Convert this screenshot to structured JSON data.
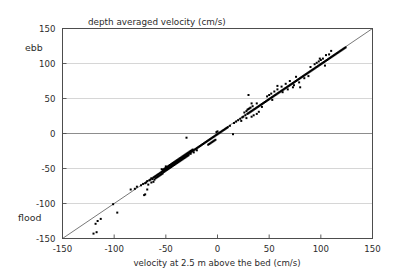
{
  "chart_data": {
    "type": "scatter",
    "title": "depth averaged velocity (cm/s)",
    "xlabel": "velocity at 2.5 m above the bed (cm/s)",
    "ylabel": "",
    "xlim": [
      -150,
      150
    ],
    "ylim": [
      -150,
      150
    ],
    "xticks": [
      -150,
      -100,
      -50,
      0,
      50,
      100,
      150
    ],
    "yticks": [
      -150,
      -100,
      -50,
      0,
      50,
      100,
      150
    ],
    "xticklabels": [
      "-150",
      "-100",
      "-50",
      "0",
      "50",
      "100",
      "150"
    ],
    "yticklabels": [
      "-150",
      "-100",
      "-50",
      "0",
      "50",
      "100",
      "150"
    ],
    "grid": "horizontal",
    "grid_color": "#cccccc",
    "zero_line_color": "#808080",
    "marker": "square",
    "marker_size": 2,
    "marker_color": "#000000",
    "reference_line": {
      "name": "one-to-one-line",
      "from": [
        -150,
        -150
      ],
      "to": [
        150,
        150
      ],
      "color": "#555555"
    },
    "annotations": [
      {
        "name": "ebb-label",
        "text": "ebb",
        "x": -150,
        "y": 120,
        "position": "left-outside"
      },
      {
        "name": "flood-label",
        "text": "flood",
        "x": -150,
        "y": -125,
        "position": "left-outside"
      }
    ],
    "points": [
      [
        -120,
        -143
      ],
      [
        -117,
        -141
      ],
      [
        -118,
        -129
      ],
      [
        -116,
        -125
      ],
      [
        -113,
        -122
      ],
      [
        -101,
        -101
      ],
      [
        -97,
        -113
      ],
      [
        -84,
        -80
      ],
      [
        -80,
        -79
      ],
      [
        -78,
        -76
      ],
      [
        -74,
        -74
      ],
      [
        -72,
        -72
      ],
      [
        -71,
        -88
      ],
      [
        -70,
        -87
      ],
      [
        -70,
        -71
      ],
      [
        -69,
        -70
      ],
      [
        -68,
        -80
      ],
      [
        -68,
        -68
      ],
      [
        -67,
        -73
      ],
      [
        -66,
        -67
      ],
      [
        -65,
        -66
      ],
      [
        -64,
        -70
      ],
      [
        -64,
        -64
      ],
      [
        -63,
        -65
      ],
      [
        -62,
        -63
      ],
      [
        -62,
        -69
      ],
      [
        -61,
        -62
      ],
      [
        -61,
        -66
      ],
      [
        -60,
        -61
      ],
      [
        -60,
        -64
      ],
      [
        -59,
        -60
      ],
      [
        -59,
        -63
      ],
      [
        -58,
        -59
      ],
      [
        -58,
        -62
      ],
      [
        -57,
        -58
      ],
      [
        -57,
        -61
      ],
      [
        -56,
        -57
      ],
      [
        -56,
        -60
      ],
      [
        -55,
        -56
      ],
      [
        -55,
        -59
      ],
      [
        -54,
        -55
      ],
      [
        -54,
        -58
      ],
      [
        -54,
        -51
      ],
      [
        -53,
        -54
      ],
      [
        -53,
        -52
      ],
      [
        -53,
        -57
      ],
      [
        -52,
        -53
      ],
      [
        -52,
        -51
      ],
      [
        -52,
        -55
      ],
      [
        -51,
        -52
      ],
      [
        -51,
        -50
      ],
      [
        -51,
        -54
      ],
      [
        -50,
        -51
      ],
      [
        -50,
        -49
      ],
      [
        -50,
        -53
      ],
      [
        -50,
        -47
      ],
      [
        -49,
        -50
      ],
      [
        -49,
        -48
      ],
      [
        -49,
        -52
      ],
      [
        -48,
        -49
      ],
      [
        -48,
        -47
      ],
      [
        -48,
        -51
      ],
      [
        -47,
        -48
      ],
      [
        -47,
        -46
      ],
      [
        -47,
        -50
      ],
      [
        -46,
        -47
      ],
      [
        -46,
        -45
      ],
      [
        -46,
        -49
      ],
      [
        -45,
        -46
      ],
      [
        -45,
        -44
      ],
      [
        -45,
        -48
      ],
      [
        -44,
        -45
      ],
      [
        -44,
        -43
      ],
      [
        -44,
        -47
      ],
      [
        -43,
        -44
      ],
      [
        -43,
        -42
      ],
      [
        -43,
        -46
      ],
      [
        -42,
        -43
      ],
      [
        -42,
        -41
      ],
      [
        -42,
        -45
      ],
      [
        -41,
        -42
      ],
      [
        -41,
        -40
      ],
      [
        -41,
        -44
      ],
      [
        -40,
        -41
      ],
      [
        -40,
        -39
      ],
      [
        -40,
        -43
      ],
      [
        -39,
        -40
      ],
      [
        -39,
        -38
      ],
      [
        -39,
        -42
      ],
      [
        -38,
        -39
      ],
      [
        -38,
        -37
      ],
      [
        -38,
        -41
      ],
      [
        -37,
        -38
      ],
      [
        -37,
        -36
      ],
      [
        -37,
        -40
      ],
      [
        -36,
        -37
      ],
      [
        -36,
        -35
      ],
      [
        -36,
        -39
      ],
      [
        -35,
        -36
      ],
      [
        -35,
        -34
      ],
      [
        -35,
        -38
      ],
      [
        -34,
        -35
      ],
      [
        -34,
        -33
      ],
      [
        -34,
        -37
      ],
      [
        -33,
        -34
      ],
      [
        -33,
        -32
      ],
      [
        -33,
        -36
      ],
      [
        -32,
        -33
      ],
      [
        -32,
        -31
      ],
      [
        -32,
        -35
      ],
      [
        -31,
        -32
      ],
      [
        -31,
        -30
      ],
      [
        -31,
        -34
      ],
      [
        -30,
        -31
      ],
      [
        -30,
        -29
      ],
      [
        -30,
        -33
      ],
      [
        -30,
        -6
      ],
      [
        -29,
        -30
      ],
      [
        -29,
        -28
      ],
      [
        -29,
        -32
      ],
      [
        -28,
        -29
      ],
      [
        -28,
        -27
      ],
      [
        -28,
        -31
      ],
      [
        -27,
        -28
      ],
      [
        -27,
        -26
      ],
      [
        -26,
        -27
      ],
      [
        -26,
        -25
      ],
      [
        -26,
        -29
      ],
      [
        -25,
        -26
      ],
      [
        -25,
        -24
      ],
      [
        -24,
        -25
      ],
      [
        -24,
        -23
      ],
      [
        -23,
        -24
      ],
      [
        -23,
        -27
      ],
      [
        -22,
        -23
      ],
      [
        -21,
        -22
      ],
      [
        -20,
        -21
      ],
      [
        -20,
        -24
      ],
      [
        -19,
        -20
      ],
      [
        -18,
        -19
      ],
      [
        -17,
        -18
      ],
      [
        -16,
        -17
      ],
      [
        -15,
        -16
      ],
      [
        -14,
        -15
      ],
      [
        -13,
        -14
      ],
      [
        -12,
        -13
      ],
      [
        -11,
        -12
      ],
      [
        -10,
        -11
      ],
      [
        -9,
        -10
      ],
      [
        -9,
        -16
      ],
      [
        -8,
        -9
      ],
      [
        -8,
        -15
      ],
      [
        -7,
        -8
      ],
      [
        -7,
        -14
      ],
      [
        -6,
        -7
      ],
      [
        -6,
        -13
      ],
      [
        -5,
        -6
      ],
      [
        -5,
        -12
      ],
      [
        -4,
        -5
      ],
      [
        -4,
        -11
      ],
      [
        -3,
        -4
      ],
      [
        -3,
        -10
      ],
      [
        -2,
        -3
      ],
      [
        -2,
        -9
      ],
      [
        -1,
        -2
      ],
      [
        -1,
        2
      ],
      [
        0,
        -1
      ],
      [
        0,
        3
      ],
      [
        1,
        0
      ],
      [
        2,
        1
      ],
      [
        3,
        2
      ],
      [
        4,
        3
      ],
      [
        5,
        4
      ],
      [
        6,
        5
      ],
      [
        7,
        6
      ],
      [
        8,
        7
      ],
      [
        9,
        8
      ],
      [
        10,
        9
      ],
      [
        12,
        11
      ],
      [
        15,
        -1
      ],
      [
        16,
        15
      ],
      [
        18,
        17
      ],
      [
        20,
        19
      ],
      [
        22,
        21
      ],
      [
        24,
        23
      ],
      [
        25,
        24
      ],
      [
        26,
        30
      ],
      [
        27,
        26
      ],
      [
        28,
        32
      ],
      [
        29,
        28
      ],
      [
        29,
        34
      ],
      [
        30,
        29
      ],
      [
        30,
        35
      ],
      [
        30,
        55
      ],
      [
        31,
        30
      ],
      [
        31,
        36
      ],
      [
        32,
        31
      ],
      [
        32,
        37
      ],
      [
        33,
        32
      ],
      [
        33,
        24
      ],
      [
        34,
        33
      ],
      [
        34,
        39
      ],
      [
        35,
        34
      ],
      [
        35,
        26
      ],
      [
        36,
        35
      ],
      [
        37,
        36
      ],
      [
        38,
        37
      ],
      [
        38,
        43
      ],
      [
        39,
        38
      ],
      [
        40,
        39
      ],
      [
        40,
        31
      ],
      [
        41,
        40
      ],
      [
        42,
        41
      ],
      [
        43,
        42
      ],
      [
        44,
        43
      ],
      [
        45,
        44
      ],
      [
        46,
        45
      ],
      [
        47,
        46
      ],
      [
        48,
        47
      ],
      [
        49,
        48
      ],
      [
        50,
        49
      ],
      [
        50,
        55
      ],
      [
        51,
        50
      ],
      [
        52,
        51
      ],
      [
        52,
        57
      ],
      [
        53,
        52
      ],
      [
        54,
        53
      ],
      [
        55,
        54
      ],
      [
        55,
        60
      ],
      [
        56,
        55
      ],
      [
        57,
        56
      ],
      [
        58,
        57
      ],
      [
        58,
        63
      ],
      [
        59,
        58
      ],
      [
        60,
        59
      ],
      [
        61,
        60
      ],
      [
        62,
        61
      ],
      [
        62,
        67
      ],
      [
        63,
        62
      ],
      [
        64,
        63
      ],
      [
        65,
        64
      ],
      [
        66,
        65
      ],
      [
        66,
        71
      ],
      [
        67,
        66
      ],
      [
        68,
        67
      ],
      [
        69,
        68
      ],
      [
        70,
        69
      ],
      [
        70,
        75
      ],
      [
        71,
        70
      ],
      [
        72,
        71
      ],
      [
        73,
        72
      ],
      [
        73,
        66
      ],
      [
        74,
        73
      ],
      [
        75,
        74
      ],
      [
        76,
        75
      ],
      [
        76,
        81
      ],
      [
        77,
        76
      ],
      [
        78,
        77
      ],
      [
        79,
        78
      ],
      [
        80,
        79
      ],
      [
        80,
        66
      ],
      [
        81,
        80
      ],
      [
        82,
        81
      ],
      [
        83,
        82
      ],
      [
        84,
        83
      ],
      [
        85,
        84
      ],
      [
        86,
        85
      ],
      [
        87,
        86
      ],
      [
        88,
        87
      ],
      [
        89,
        88
      ],
      [
        90,
        89
      ],
      [
        90,
        95
      ],
      [
        91,
        90
      ],
      [
        92,
        91
      ],
      [
        93,
        92
      ],
      [
        94,
        93
      ],
      [
        94,
        99
      ],
      [
        95,
        94
      ],
      [
        96,
        95
      ],
      [
        96,
        101
      ],
      [
        97,
        96
      ],
      [
        98,
        97
      ],
      [
        98,
        103
      ],
      [
        99,
        98
      ],
      [
        100,
        99
      ],
      [
        100,
        105
      ],
      [
        101,
        100
      ],
      [
        102,
        101
      ],
      [
        102,
        107
      ],
      [
        103,
        102
      ],
      [
        104,
        103
      ],
      [
        104,
        97
      ],
      [
        105,
        104
      ],
      [
        106,
        105
      ],
      [
        107,
        106
      ],
      [
        108,
        107
      ],
      [
        108,
        113
      ],
      [
        109,
        108
      ],
      [
        110,
        109
      ],
      [
        111,
        110
      ],
      [
        112,
        111
      ],
      [
        113,
        112
      ],
      [
        114,
        113
      ],
      [
        115,
        114
      ],
      [
        116,
        115
      ],
      [
        117,
        116
      ],
      [
        118,
        117
      ],
      [
        119,
        118
      ],
      [
        120,
        119
      ],
      [
        121,
        120
      ],
      [
        122,
        121
      ],
      [
        123,
        122
      ],
      [
        124,
        123
      ],
      [
        110,
        118
      ],
      [
        105,
        112
      ],
      [
        99,
        107
      ],
      [
        88,
        82
      ],
      [
        84,
        79
      ],
      [
        79,
        73
      ],
      [
        74,
        69
      ],
      [
        68,
        63
      ],
      [
        63,
        59
      ],
      [
        58,
        68
      ],
      [
        53,
        48
      ],
      [
        48,
        53
      ],
      [
        43,
        38
      ],
      [
        38,
        28
      ],
      [
        33,
        43
      ],
      [
        28,
        22
      ],
      [
        23,
        18
      ]
    ]
  }
}
